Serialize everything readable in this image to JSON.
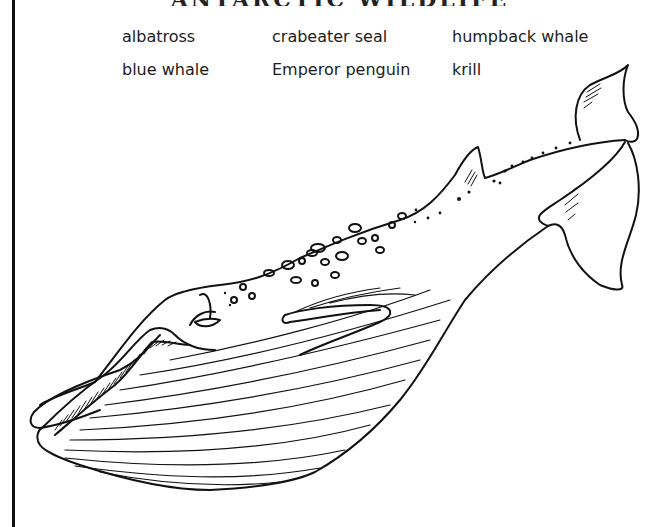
{
  "page": {
    "title_visible": "ANTARCTIC WILDLIFE",
    "title_clipped": true
  },
  "word_bank": {
    "columns": [
      [
        "albatross",
        "blue whale"
      ],
      [
        "crabeater seal",
        "Emperor penguin"
      ],
      [
        "humpback whale",
        "krill"
      ]
    ]
  },
  "illustration": {
    "subject": "blue-whale-line-drawing",
    "style": "black ink line art",
    "stroke_color": "#111111",
    "background_color": "#ffffff"
  }
}
